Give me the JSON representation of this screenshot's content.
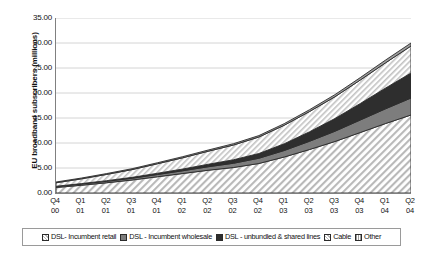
{
  "chart_data": {
    "type": "area",
    "title": "",
    "subtitle": "",
    "xlabel": "",
    "ylabel": "EU broadband subscribers (millions)",
    "stacked": true,
    "grid": true,
    "legend_position": "bottom",
    "ylim": [
      0,
      35
    ],
    "ytick_labels": [
      "0.00",
      "5.00",
      "10.00",
      "15.00",
      "20.00",
      "25.00",
      "30.00",
      "35.00"
    ],
    "ytick_values": [
      0,
      5,
      10,
      15,
      20,
      25,
      30,
      35
    ],
    "categories": [
      "Q4 00",
      "Q1 01",
      "Q2 01",
      "Q3 01",
      "Q4 01",
      "Q1 02",
      "Q2 02",
      "Q3 02",
      "Q4 02",
      "Q1 03",
      "Q2 03",
      "Q3 03",
      "Q4 03",
      "Q1 04",
      "Q2 04"
    ],
    "x": [
      {
        "q": "Q4",
        "yy": "00"
      },
      {
        "q": "Q1",
        "yy": "01"
      },
      {
        "q": "Q2",
        "yy": "01"
      },
      {
        "q": "Q3",
        "yy": "01"
      },
      {
        "q": "Q4",
        "yy": "01"
      },
      {
        "q": "Q1",
        "yy": "02"
      },
      {
        "q": "Q2",
        "yy": "02"
      },
      {
        "q": "Q3",
        "yy": "02"
      },
      {
        "q": "Q4",
        "yy": "02"
      },
      {
        "q": "Q1",
        "yy": "03"
      },
      {
        "q": "Q2",
        "yy": "03"
      },
      {
        "q": "Q3",
        "yy": "03"
      },
      {
        "q": "Q4",
        "yy": "03"
      },
      {
        "q": "Q1",
        "yy": "04"
      },
      {
        "q": "Q2",
        "yy": "04"
      }
    ],
    "series": [
      {
        "name": "DSL- Incumbent retail",
        "fill": "hatch-diag-light",
        "color": "#e8e8e8",
        "values": [
          1.1,
          1.55,
          2.05,
          2.6,
          3.25,
          3.9,
          4.55,
          5.1,
          5.9,
          7.2,
          8.7,
          10.3,
          12.1,
          13.9,
          15.6
        ]
      },
      {
        "name": "DSL - Incumbent wholesale",
        "fill": "solid-gray",
        "color": "#808080",
        "values": [
          0.2,
          0.25,
          0.3,
          0.35,
          0.45,
          0.55,
          0.7,
          0.85,
          1.05,
          1.3,
          1.65,
          2.05,
          2.5,
          2.95,
          3.4
        ]
      },
      {
        "name": "DSL - unbundled & shared lines",
        "fill": "solid-dark",
        "color": "#333333",
        "values": [
          0.05,
          0.08,
          0.12,
          0.18,
          0.25,
          0.35,
          0.5,
          0.7,
          0.95,
          1.35,
          1.9,
          2.55,
          3.3,
          4.15,
          5.0
        ]
      },
      {
        "name": "Cable",
        "fill": "hatch-diag-light",
        "color": "#ededed",
        "values": [
          0.7,
          0.95,
          1.25,
          1.55,
          1.9,
          2.25,
          2.6,
          2.95,
          3.3,
          3.7,
          4.05,
          4.35,
          4.7,
          5.05,
          5.4
        ]
      },
      {
        "name": "Other",
        "fill": "solid-gray-light",
        "color": "#9e9e9e",
        "values": [
          0.15,
          0.16,
          0.17,
          0.18,
          0.2,
          0.22,
          0.24,
          0.26,
          0.28,
          0.32,
          0.36,
          0.42,
          0.48,
          0.55,
          0.6
        ]
      }
    ],
    "totals": [
      2.2,
      2.99,
      3.89,
      4.86,
      6.05,
      7.27,
      8.59,
      9.86,
      11.48,
      13.87,
      16.66,
      19.67,
      23.08,
      26.6,
      30.0
    ]
  },
  "axis": {
    "y_title": "EU broadband subscribers (millions)"
  },
  "legend": {
    "items": [
      {
        "label": "DSL- Incumbent retail",
        "swatch": "hatch-light-swatch"
      },
      {
        "label": "DSL - Incumbent wholesale",
        "swatch": "gray-swatch"
      },
      {
        "label": "DSL - unbundled & shared lines",
        "swatch": "dark-swatch"
      },
      {
        "label": "Cable",
        "swatch": "hatch-light-swatch"
      },
      {
        "label": "Other",
        "swatch": "gray-light-swatch"
      }
    ]
  }
}
